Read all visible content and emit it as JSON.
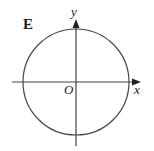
{
  "diagram": {
    "panel_label": "E",
    "axes": {
      "x_label": "x",
      "y_label": "y",
      "origin_label": "O"
    },
    "shape": "circle centered at origin",
    "colors": {
      "stroke": "#444444",
      "text": "#222222",
      "background": "#ffffff"
    }
  }
}
